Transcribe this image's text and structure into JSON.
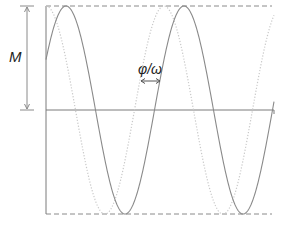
{
  "diagram": {
    "type": "phase-shifted sinusoids",
    "labels": {
      "amplitude": "M",
      "phase_shift": "φ/ω"
    },
    "curves": [
      {
        "name": "reference signal (dotted)",
        "style": "dotted",
        "color": "#c8c8c8"
      },
      {
        "name": "shifted signal (solid)",
        "style": "solid",
        "color": "#8a8a8a"
      }
    ],
    "guides": {
      "top_dashed": "peak level",
      "bottom_dashed": "trough level",
      "midline": "zero level"
    },
    "colors": {
      "axis": "#7a7a7a",
      "dashed": "#8a8a8a",
      "solid_curve": "#8a8a8a",
      "dotted_curve": "#c8c8c8",
      "text": "#222222"
    }
  }
}
